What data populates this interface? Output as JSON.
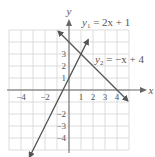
{
  "chart_data": {
    "type": "line",
    "title": "",
    "xlabel": "x",
    "ylabel": "y",
    "xlim": [
      -5,
      5
    ],
    "ylim": [
      -5,
      5
    ],
    "grid": true,
    "x_ticks": [
      -4,
      -2,
      1,
      2,
      3,
      4
    ],
    "y_ticks": [
      3,
      2,
      1,
      -2,
      -3,
      -4
    ],
    "series": [
      {
        "name": "y1 = 2x + 1",
        "label_main": "y",
        "label_sub": "1",
        "label_rest": " = 2x + 1",
        "equation": {
          "slope": 2,
          "intercept": 1
        },
        "x": [
          -3.3,
          0,
          1,
          1.6
        ],
        "y": [
          -5.6,
          1,
          3,
          4.2
        ]
      },
      {
        "name": "y2 = -x + 4",
        "label_main": "y",
        "label_sub": "2",
        "label_rest": " = −x + 4",
        "equation": {
          "slope": -1,
          "intercept": 4
        },
        "x": [
          -0.9,
          0,
          1,
          4,
          4.9
        ],
        "y": [
          4.9,
          4,
          3,
          0,
          -0.9
        ]
      }
    ],
    "annotations": [
      {
        "text": "intersection",
        "x": 1,
        "y": 3
      }
    ],
    "colors": {
      "line": "#555555",
      "grid": "#d4d4d4",
      "axis": "#666666",
      "text": "#555555"
    }
  }
}
